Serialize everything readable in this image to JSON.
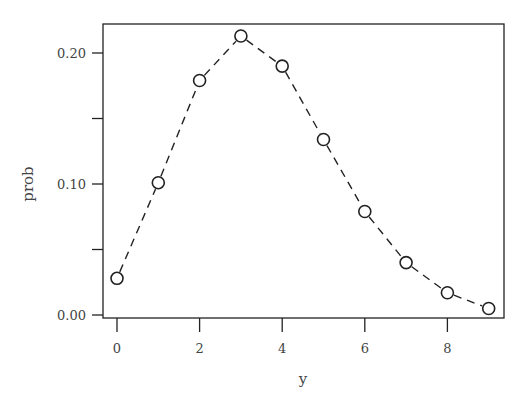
{
  "chart_data": {
    "type": "line",
    "title": "",
    "xlabel": "y",
    "ylabel": "prob",
    "x": [
      0,
      1,
      2,
      3,
      4,
      5,
      6,
      7,
      8,
      9
    ],
    "series": [
      {
        "name": "prob",
        "values": [
          0.028,
          0.101,
          0.179,
          0.213,
          0.19,
          0.134,
          0.079,
          0.04,
          0.017,
          0.005
        ],
        "style": "dashed line with open circle markers"
      }
    ],
    "xticks": [
      0,
      2,
      4,
      6,
      8
    ],
    "xtick_labels": [
      "0",
      "2",
      "4",
      "6",
      "8"
    ],
    "yticks": [
      0.0,
      0.05,
      0.1,
      0.15,
      0.2
    ],
    "ytick_labels": [
      "0.00",
      "",
      "0.10",
      "",
      "0.20"
    ],
    "xlim": [
      -0.3,
      9.3
    ],
    "ylim": [
      0.0,
      0.222
    ],
    "grid": false,
    "legend": null
  }
}
